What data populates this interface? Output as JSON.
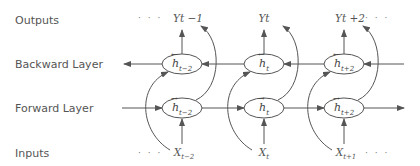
{
  "rows": {
    "outputs": "Outputs",
    "backward": "Backward Layer",
    "forward": "Forward Layer",
    "inputs": "Inputs"
  },
  "outputs": [
    {
      "base": "Yt",
      "suffix": " −1"
    },
    {
      "base": "Yt",
      "suffix": ""
    },
    {
      "base": "Yt",
      "suffix": " +2"
    }
  ],
  "inputs": [
    {
      "base": "X",
      "sub": "t−2"
    },
    {
      "base": "X",
      "sub": "t"
    },
    {
      "base": "X",
      "sub": "t+1"
    }
  ],
  "backward_nodes": [
    {
      "glyph": "h",
      "arrow": "←",
      "sub": "t−2"
    },
    {
      "glyph": "h",
      "arrow": "←",
      "sub": "t"
    },
    {
      "glyph": "h",
      "arrow": "←",
      "sub": "t+2"
    }
  ],
  "forward_nodes": [
    {
      "glyph": "h",
      "arrow": "→",
      "sub": "t−2"
    },
    {
      "glyph": "h",
      "arrow": "→",
      "sub": "t"
    },
    {
      "glyph": "h",
      "arrow": "→",
      "sub": "t+2"
    }
  ],
  "ellipsis": "· · ·",
  "colors": {
    "stroke": "#555555",
    "text": "#555555"
  }
}
